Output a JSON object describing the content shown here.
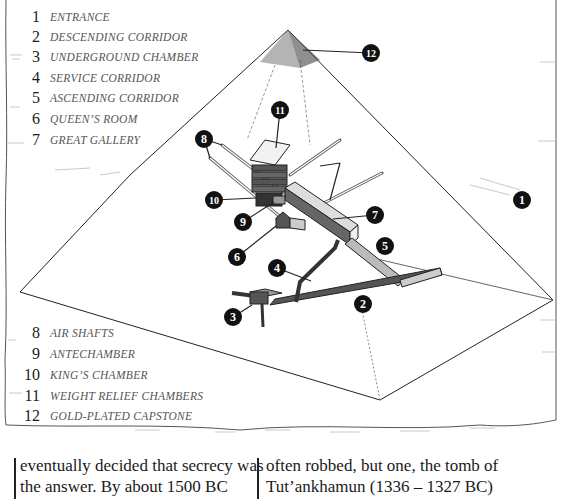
{
  "diagram": {
    "callout_color": "#111111",
    "callout_text_color": "#ffffff"
  },
  "legend_top": [
    {
      "num": "1",
      "label": "Entrance"
    },
    {
      "num": "2",
      "label": "Descending corridor"
    },
    {
      "num": "3",
      "label": "Underground chamber"
    },
    {
      "num": "4",
      "label": "Service corridor"
    },
    {
      "num": "5",
      "label": "Ascending corridor"
    },
    {
      "num": "6",
      "label": "Queen’s room"
    },
    {
      "num": "7",
      "label": "Great gallery"
    }
  ],
  "legend_bottom": [
    {
      "num": "8",
      "label": "Air shafts"
    },
    {
      "num": "9",
      "label": "Antechamber"
    },
    {
      "num": "10",
      "label": "King’s chamber"
    },
    {
      "num": "11",
      "label": "Weight relief chambers"
    },
    {
      "num": "12",
      "label": "Gold-plated capstone"
    }
  ],
  "callouts": [
    {
      "num": "1",
      "x": 522,
      "y": 200
    },
    {
      "num": "2",
      "x": 363,
      "y": 304
    },
    {
      "num": "3",
      "x": 233,
      "y": 317
    },
    {
      "num": "4",
      "x": 277,
      "y": 268
    },
    {
      "num": "5",
      "x": 385,
      "y": 246
    },
    {
      "num": "6",
      "x": 237,
      "y": 257
    },
    {
      "num": "7",
      "x": 375,
      "y": 215
    },
    {
      "num": "8",
      "x": 204,
      "y": 139
    },
    {
      "num": "9",
      "x": 243,
      "y": 222
    },
    {
      "num": "10",
      "x": 214,
      "y": 200
    },
    {
      "num": "11",
      "x": 280,
      "y": 110
    },
    {
      "num": "12",
      "x": 371,
      "y": 53
    }
  ],
  "text_columns": {
    "left": [
      "eventually decided that secrecy was",
      "the answer. By about 1500 BC"
    ],
    "right": [
      "often robbed, but one, the tomb of",
      "Tut’ankhamun (1336 – 1327 BC)"
    ]
  }
}
